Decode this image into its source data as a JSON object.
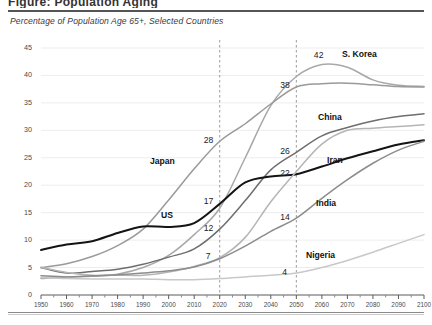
{
  "page": {
    "cut_title": "Figure: Population Aging",
    "subtitle": "Percentage of Population Age 65+, Selected Countries"
  },
  "chart_data": {
    "type": "line",
    "title": "Percentage of Population Age 65+, Selected Countries",
    "xlabel": "",
    "ylabel": "",
    "xlim": [
      1950,
      2100
    ],
    "ylim": [
      0,
      45
    ],
    "grid": true,
    "legend_position": "inline-labels",
    "x": [
      1950,
      1960,
      1970,
      1980,
      1990,
      2000,
      2010,
      2020,
      2030,
      2040,
      2050,
      2060,
      2070,
      2080,
      2090,
      2100
    ],
    "xticks": [
      "1950",
      "1960",
      "1970",
      "1980",
      "1990",
      "2000",
      "2010",
      "2020",
      "2030",
      "2040",
      "2050",
      "2060",
      "2070",
      "2080",
      "2090",
      "2100"
    ],
    "yticks": [
      "0",
      "5",
      "10",
      "15",
      "20",
      "25",
      "30",
      "35",
      "40",
      "45"
    ],
    "reference_lines": [
      2020,
      2050
    ],
    "series": [
      {
        "name": "S. Korea",
        "color": "#a8a8a8",
        "values": [
          3.0,
          3.3,
          3.4,
          3.8,
          5.0,
          7.2,
          11.0,
          15.8,
          25.0,
          34.5,
          39.8,
          42.0,
          41.5,
          39.2,
          38.2,
          38.0
        ]
      },
      {
        "name": "Japan",
        "color": "#9a9a9a",
        "values": [
          5.0,
          5.7,
          7.0,
          9.0,
          12.0,
          17.3,
          23.0,
          28.0,
          31.2,
          34.8,
          37.9,
          38.5,
          38.6,
          38.3,
          38.0,
          37.9
        ]
      },
      {
        "name": "China",
        "color": "#6e6e6e",
        "values": [
          5.0,
          4.0,
          4.3,
          4.7,
          5.6,
          6.9,
          8.4,
          12.0,
          17.2,
          22.8,
          26.0,
          29.0,
          30.5,
          31.7,
          32.5,
          33.0
        ]
      },
      {
        "name": "US",
        "color": "#141414",
        "values": [
          8.2,
          9.2,
          9.8,
          11.3,
          12.5,
          12.4,
          13.1,
          16.6,
          20.5,
          21.6,
          22.0,
          23.4,
          24.9,
          26.2,
          27.4,
          28.2
        ]
      },
      {
        "name": "Iran",
        "color": "#b5b5b5",
        "values": [
          5.0,
          4.1,
          3.6,
          3.6,
          3.6,
          4.2,
          5.2,
          6.8,
          10.5,
          17.0,
          22.5,
          27.5,
          30.0,
          30.4,
          30.7,
          31.0
        ]
      },
      {
        "name": "India",
        "color": "#8c8c8c",
        "values": [
          3.5,
          3.3,
          3.5,
          3.7,
          4.0,
          4.4,
          5.1,
          6.6,
          8.9,
          11.6,
          14.0,
          17.6,
          21.0,
          24.0,
          26.4,
          28.0
        ]
      },
      {
        "name": "Nigeria",
        "color": "#c8c8c8",
        "values": [
          3.2,
          3.0,
          2.9,
          2.9,
          2.9,
          2.8,
          2.8,
          3.0,
          3.3,
          3.6,
          4.0,
          5.0,
          6.3,
          7.8,
          9.4,
          11.0
        ]
      }
    ],
    "annotations": [
      {
        "label": "28",
        "x": 2020,
        "y": 28,
        "series": "Japan"
      },
      {
        "label": "17",
        "x": 2020,
        "y": 17,
        "series": "US"
      },
      {
        "label": "12",
        "x": 2020,
        "y": 12,
        "series": "China"
      },
      {
        "label": "7",
        "x": 2020,
        "y": 7,
        "series": "Iran"
      },
      {
        "label": "38",
        "x": 2050,
        "y": 38,
        "series": "Japan"
      },
      {
        "label": "42",
        "x": 2060,
        "y": 42,
        "series": "S. Korea"
      },
      {
        "label": "26",
        "x": 2050,
        "y": 26,
        "series": "China"
      },
      {
        "label": "22",
        "x": 2050,
        "y": 22,
        "series": "US"
      },
      {
        "label": "14",
        "x": 2050,
        "y": 14,
        "series": "India"
      },
      {
        "label": "4",
        "x": 2050,
        "y": 4,
        "series": "Nigeria"
      }
    ],
    "series_labels": [
      {
        "name": "S. Korea",
        "px": 342,
        "py": 50
      },
      {
        "name": "China",
        "px": 318,
        "py": 113
      },
      {
        "name": "Japan",
        "px": 150,
        "py": 157
      },
      {
        "name": "Iran",
        "px": 327,
        "py": 156
      },
      {
        "name": "US",
        "px": 161,
        "py": 211
      },
      {
        "name": "India",
        "px": 316,
        "py": 199
      },
      {
        "name": "Nigeria",
        "px": 306,
        "py": 251
      }
    ]
  }
}
